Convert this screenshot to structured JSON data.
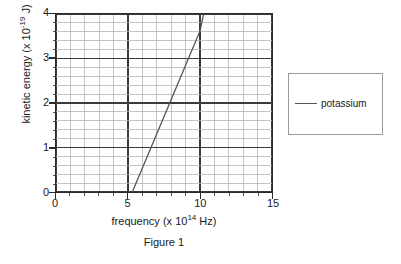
{
  "figure": {
    "caption": "Figure 1"
  },
  "axes": {
    "x": {
      "title_prefix": "frequency (x 10",
      "title_exponent": "14",
      "title_suffix": " Hz)",
      "ticks": [
        "0",
        "5",
        "10",
        "15"
      ]
    },
    "y": {
      "title_prefix": "kinetic energy (x 10",
      "title_exponent": "-19",
      "title_suffix": " J)",
      "ticks": [
        "4",
        "3",
        "2",
        "1",
        "0"
      ]
    }
  },
  "legend": {
    "entries": [
      {
        "label": "potassium",
        "color": "#555555"
      }
    ]
  },
  "colors": {
    "series_line": "#555555",
    "major_grid": "#3a3a3a",
    "minor_grid": "#b4b4b4",
    "axis": "#2b2b2b",
    "legend_border": "#9a9a9a"
  },
  "chart_data": {
    "type": "line",
    "title": "Figure 1",
    "xlabel": "frequency (x 10^14 Hz)",
    "ylabel": "kinetic energy (x 10^-19 J)",
    "xlim": [
      0,
      15
    ],
    "ylim": [
      0,
      4
    ],
    "x_major_ticks": [
      0,
      5,
      10,
      15
    ],
    "y_major_ticks": [
      0,
      1,
      2,
      3,
      4
    ],
    "x_minor_step": 1,
    "y_minor_step": 0.2,
    "grid": true,
    "legend_position": "right",
    "series": [
      {
        "name": "potassium",
        "color": "#555555",
        "x": [
          5.3,
          6,
          7,
          8,
          9,
          10,
          10.25
        ],
        "y": [
          0,
          0.54,
          1.31,
          2.08,
          2.85,
          3.62,
          4.0
        ],
        "line_start": {
          "x": 5.3,
          "y": 0
        },
        "line_end": {
          "x": 10.25,
          "y": 4
        },
        "x_intercept": 5.3,
        "slope": 0.77
      }
    ]
  }
}
